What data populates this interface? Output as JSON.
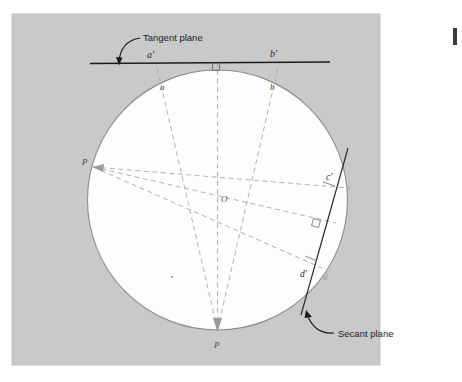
{
  "figure": {
    "kind": "geometry-diagram",
    "background_color": "#ffffff",
    "panel_color": "#c9c9c9",
    "circle_fill": "#fdfdfd",
    "circle_stroke": "#8c8c8c",
    "solid_line_color": "#1c1c1c",
    "dashed_line_color": "#a0a0a0",
    "callouts": {
      "tangent_plane": "Tangent plane",
      "secant_plane": "Secant plane"
    },
    "point_labels": {
      "a_prime": "a'",
      "b_prime": "b'",
      "c_prime": "c'",
      "d_prime": "d'",
      "a": "a",
      "b": "b",
      "c": "c",
      "d": "d",
      "center": "O",
      "p_left": "P",
      "p_bottom": "P"
    }
  }
}
